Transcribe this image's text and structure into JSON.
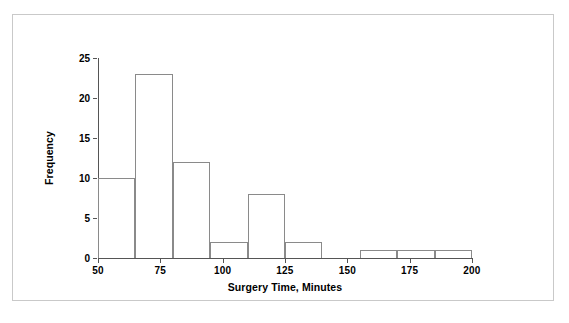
{
  "figure": {
    "background_color": "#ffffff",
    "frame_color": "#c9c9c9",
    "axis_color": "#555555",
    "bar_stroke_color": "#8a8a8a"
  },
  "chart_data": {
    "type": "bar",
    "subtype": "histogram",
    "title": "",
    "xlabel": "Surgery Time, Minutes",
    "ylabel": "Frequency",
    "xlim": [
      50,
      200
    ],
    "ylim": [
      0,
      25
    ],
    "bin_width": 15,
    "grid": false,
    "legend": null,
    "x_ticks": [
      50,
      75,
      100,
      125,
      150,
      175,
      200
    ],
    "x_tick_labels": [
      "50",
      "75",
      "100",
      "125",
      "150",
      "175",
      "200"
    ],
    "y_ticks": [
      0,
      5,
      10,
      15,
      20,
      25
    ],
    "y_tick_labels": [
      "0",
      "5",
      "10",
      "15",
      "20",
      "25"
    ],
    "bins": [
      {
        "start": 50,
        "end": 65,
        "frequency": 10
      },
      {
        "start": 65,
        "end": 80,
        "frequency": 23
      },
      {
        "start": 80,
        "end": 95,
        "frequency": 12
      },
      {
        "start": 95,
        "end": 110,
        "frequency": 2
      },
      {
        "start": 110,
        "end": 125,
        "frequency": 8
      },
      {
        "start": 125,
        "end": 140,
        "frequency": 2
      },
      {
        "start": 140,
        "end": 155,
        "frequency": 0
      },
      {
        "start": 155,
        "end": 170,
        "frequency": 1
      },
      {
        "start": 170,
        "end": 185,
        "frequency": 1
      },
      {
        "start": 185,
        "end": 200,
        "frequency": 1
      }
    ],
    "categories": [
      "50-65",
      "65-80",
      "80-95",
      "95-110",
      "110-125",
      "125-140",
      "140-155",
      "155-170",
      "170-185",
      "185-200"
    ],
    "values": [
      10,
      23,
      12,
      2,
      8,
      2,
      0,
      1,
      1,
      1
    ]
  }
}
